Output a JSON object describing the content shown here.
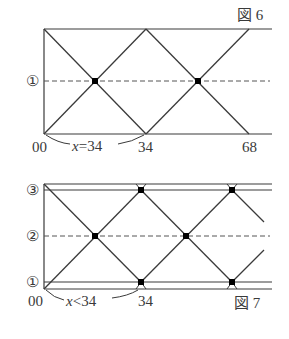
{
  "figures": [
    {
      "id": "fig6",
      "caption": "図 6",
      "row_labels": [
        "①"
      ],
      "axis_labels": [
        "00",
        "34",
        "68"
      ],
      "annotation": "x=34",
      "annotation_var": "x",
      "annotation_rel": "=34"
    },
    {
      "id": "fig7",
      "caption": "図 7",
      "row_labels": [
        "③",
        "②",
        "①"
      ],
      "axis_labels": [
        "00",
        "34"
      ],
      "annotation": "x<34",
      "annotation_var": "x",
      "annotation_rel": "<34"
    }
  ],
  "colors": {
    "line": "#3a3a3a",
    "dash": "#555555",
    "dot": "#000000"
  }
}
